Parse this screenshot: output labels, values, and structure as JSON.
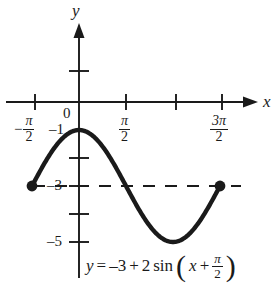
{
  "figure": {
    "kind": "math-graph",
    "background_color": "#ffffff",
    "ink_color": "#1a1a1a"
  },
  "axes": {
    "x_axis_label": "x",
    "y_axis_label": "y",
    "origin_label": "0",
    "x_tick_labels": [
      {
        "value": -1.5708,
        "text": "-π/2",
        "sign": "−",
        "numerator": "π",
        "denominator": "2"
      },
      {
        "value": 1.5708,
        "text": "π/2",
        "sign": "",
        "numerator": "π",
        "denominator": "2"
      },
      {
        "value": 4.7124,
        "text": "3π/2",
        "sign": "",
        "numerator": "3π",
        "denominator": "2"
      }
    ],
    "y_tick_labels": [
      {
        "value": -1,
        "text": "–1"
      },
      {
        "value": -3,
        "text": "–3"
      },
      {
        "value": -5,
        "text": "–5"
      }
    ],
    "x_range": [
      -2.6,
      6.1
    ],
    "y_range": [
      -6.1,
      2.2
    ],
    "grid": false
  },
  "equation": {
    "lhs": "y",
    "equals": "=",
    "constant": "–3",
    "plus": "+",
    "amplitude": "2",
    "function": "sin",
    "open_paren": "(",
    "arg_variable": "x",
    "arg_plus": "+",
    "arg_numerator": "π",
    "arg_denominator": "2",
    "close_paren": ")",
    "full_text": "y = –3 + 2 sin (x + π/2)"
  },
  "chart_data": {
    "type": "line",
    "title": "",
    "xlabel": "x",
    "ylabel": "y",
    "xlim": [
      -2.6,
      6.1
    ],
    "ylim": [
      -6.1,
      2.2
    ],
    "grid": false,
    "legend": null,
    "function_expression": "y = -3 + 2 sin(x + pi/2)",
    "amplitude": 2,
    "vertical_shift": -3,
    "phase_shift": 1.5707963,
    "period": 6.2831853,
    "domain_drawn": [
      -1.5707963,
      4.712389
    ],
    "midline": {
      "y": -3,
      "style": "dashed",
      "x_start": -1.5707963,
      "x_end": 4.712389
    },
    "endpoints": [
      {
        "x": -1.5707963,
        "y": -3,
        "marker": "filled-circle"
      },
      {
        "x": 4.712389,
        "y": -3,
        "marker": "filled-circle"
      }
    ],
    "key_points": [
      {
        "x": -1.5707963,
        "y": -3,
        "label": "left endpoint"
      },
      {
        "x": 0,
        "y": -1,
        "label": "maximum"
      },
      {
        "x": 1.5707963,
        "y": -3,
        "label": "midline crossing"
      },
      {
        "x": 3.1415927,
        "y": -5,
        "label": "minimum"
      },
      {
        "x": 4.712389,
        "y": -3,
        "label": "right endpoint"
      }
    ],
    "x": [
      -1.5708,
      -1.309,
      -1.0472,
      -0.7854,
      -0.5236,
      -0.2618,
      0.0,
      0.2618,
      0.5236,
      0.7854,
      1.0472,
      1.309,
      1.5708,
      1.8326,
      2.0944,
      2.3562,
      2.618,
      2.8798,
      3.1416,
      3.4034,
      3.6652,
      3.927,
      4.1888,
      4.4506,
      4.7124
    ],
    "y": [
      -3.0,
      -2.7412,
      -2.5,
      -2.2929,
      -2.134,
      -2.0341,
      -2.0,
      -2.0341,
      -2.134,
      -2.2929,
      -2.5,
      -2.7412,
      -3.0,
      -3.2588,
      -3.5,
      -3.7071,
      -3.866,
      -3.9659,
      -4.0,
      -3.9659,
      -3.866,
      -3.7071,
      -3.5,
      -3.2588,
      -3.0
    ]
  }
}
